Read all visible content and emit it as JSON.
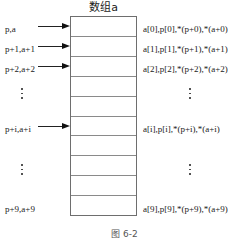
{
  "figure": {
    "array_title": "数组a",
    "caption": "图 6-2",
    "cell_count": 10,
    "colors": {
      "box_border": "#6e6e6e",
      "cell_divider": "#8a8a8a",
      "arrow": "#111111",
      "text": "#1a1a1a",
      "background": "#ffffff"
    },
    "left_labels": [
      {
        "text": "p,a",
        "row": 0,
        "has_arrow": true
      },
      {
        "text": "p+1,a+1",
        "row": 1,
        "has_arrow": true
      },
      {
        "text": "p+2,a+2",
        "row": 2,
        "has_arrow": true
      },
      {
        "text": "p+i,a+i",
        "row": 5,
        "has_arrow": true
      },
      {
        "text": "p+9,a+9",
        "row": 9,
        "has_arrow": false
      }
    ],
    "right_labels": [
      {
        "text": "a[0],p[0],*(p+0),*(a+0)",
        "row": 0
      },
      {
        "text": "a[1],p[1],*(p+1),*(a+1)",
        "row": 1
      },
      {
        "text": "a[2],p[2],*(p+2),*(a+2)",
        "row": 2
      },
      {
        "text": "a[i],p[i],*(p+i),*(a+i)",
        "row": 5
      },
      {
        "text": "a[9],p[9],*(p+9),*(a+9)",
        "row": 9
      }
    ],
    "ellipses": [
      {
        "side": "left",
        "row": 3
      },
      {
        "side": "right",
        "row": 3
      },
      {
        "side": "left",
        "row": 7
      },
      {
        "side": "right",
        "row": 7
      }
    ]
  }
}
